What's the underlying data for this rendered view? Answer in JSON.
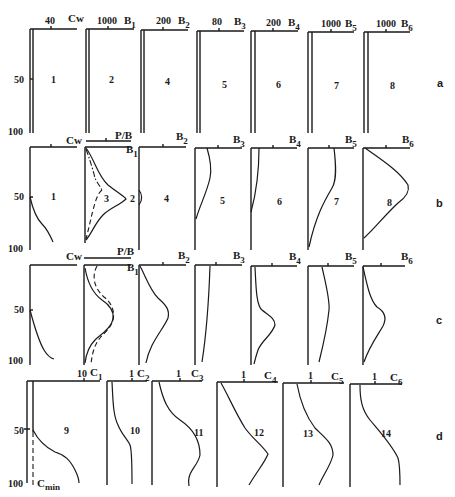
{
  "figure": {
    "depth_axis": {
      "ticks": [
        "50",
        "100"
      ]
    },
    "rows": [
      {
        "id": "a",
        "label": "a",
        "panels": [
          {
            "number": "1",
            "var": "Cw",
            "tick": "40"
          },
          {
            "number": "2",
            "var": "B",
            "sub": "1",
            "tick": "1000"
          },
          {
            "number": "4",
            "var": "B",
            "sub": "2",
            "tick": "200"
          },
          {
            "number": "5",
            "var": "B",
            "sub": "3",
            "tick": "80"
          },
          {
            "number": "6",
            "var": "B",
            "sub": "4",
            "tick": "200"
          },
          {
            "number": "7",
            "var": "B",
            "sub": "5",
            "tick": "1000"
          },
          {
            "number": "8",
            "var": "B",
            "sub": "6",
            "tick": "1000"
          }
        ]
      },
      {
        "id": "b",
        "label": "b",
        "panels": [
          {
            "number": "1",
            "var": "Cw"
          },
          {
            "number": "2",
            "number_alt": "3",
            "var": "B",
            "sub": "1",
            "extra_axis": "P/B"
          },
          {
            "number": "4",
            "var": "B",
            "sub": "2"
          },
          {
            "number": "5",
            "var": "B",
            "sub": "3"
          },
          {
            "number": "6",
            "var": "B",
            "sub": "4"
          },
          {
            "number": "7",
            "var": "B",
            "sub": "5"
          },
          {
            "number": "8",
            "var": "B",
            "sub": "6"
          }
        ]
      },
      {
        "id": "c",
        "label": "c",
        "panels": [
          {
            "var": "Cw"
          },
          {
            "var": "B",
            "sub": "1",
            "extra_axis": "P/B"
          },
          {
            "var": "B",
            "sub": "2"
          },
          {
            "var": "B",
            "sub": "3"
          },
          {
            "var": "B",
            "sub": "4"
          },
          {
            "var": "B",
            "sub": "5"
          },
          {
            "var": "B",
            "sub": "6"
          }
        ]
      },
      {
        "id": "d",
        "label": "d",
        "panels": [
          {
            "number": "9",
            "var": "C",
            "sub": "1",
            "tick": "10",
            "annotation": "C",
            "annotation_sub": "min"
          },
          {
            "number": "10",
            "var": "C",
            "sub": "2",
            "tick": "1"
          },
          {
            "number": "11",
            "var": "C",
            "sub": "3",
            "tick": "1"
          },
          {
            "number": "12",
            "var": "C",
            "sub": "4",
            "tick": "1"
          },
          {
            "number": "13",
            "var": "C",
            "sub": "5",
            "tick": "1"
          },
          {
            "number": "14",
            "var": "C",
            "sub": "6",
            "tick": "1"
          }
        ]
      }
    ]
  }
}
